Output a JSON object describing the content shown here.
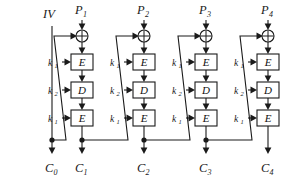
{
  "diagram": {
    "type": "block-cipher-chain",
    "width": 295,
    "height": 176,
    "background": "#ffffff",
    "line_color": "#1a1a1a",
    "box_fill": "#ffffff",
    "iv": {
      "label": "IV",
      "x": 52,
      "y_top": 26,
      "y_dot": 140
    },
    "stages": [
      {
        "index": 1,
        "cx": 82,
        "plaintext": "P",
        "plaintext_sub": "1",
        "ciphertext": "C",
        "ciphertext_sub": "1",
        "ops": [
          {
            "symbol": "E",
            "key": "k",
            "key_sub": "1"
          },
          {
            "symbol": "D",
            "key": "k",
            "key_sub": "2"
          },
          {
            "symbol": "E",
            "key": "k",
            "key_sub": "1"
          }
        ]
      },
      {
        "index": 2,
        "cx": 144,
        "plaintext": "P",
        "plaintext_sub": "2",
        "ciphertext": "C",
        "ciphertext_sub": "2",
        "ops": [
          {
            "symbol": "E",
            "key": "k",
            "key_sub": "1"
          },
          {
            "symbol": "D",
            "key": "k",
            "key_sub": "2"
          },
          {
            "symbol": "E",
            "key": "k",
            "key_sub": "1"
          }
        ]
      },
      {
        "index": 3,
        "cx": 206,
        "plaintext": "P",
        "plaintext_sub": "3",
        "ciphertext": "C",
        "ciphertext_sub": "3",
        "ops": [
          {
            "symbol": "E",
            "key": "k",
            "key_sub": "1"
          },
          {
            "symbol": "D",
            "key": "k",
            "key_sub": "2"
          },
          {
            "symbol": "E",
            "key": "k",
            "key_sub": "1"
          }
        ]
      },
      {
        "index": 4,
        "cx": 268,
        "plaintext": "P",
        "plaintext_sub": "4",
        "ciphertext": "C",
        "ciphertext_sub": "4",
        "ops": [
          {
            "symbol": "E",
            "key": "k",
            "key_sub": "1"
          },
          {
            "symbol": "D",
            "key": "k",
            "key_sub": "2"
          },
          {
            "symbol": "E",
            "key": "k",
            "key_sub": "1"
          }
        ]
      }
    ],
    "outputs": [
      {
        "label": "C",
        "sub": "0",
        "x": 52
      },
      {
        "label": "C",
        "sub": "1",
        "x": 82
      },
      {
        "label": "C",
        "sub": "2",
        "x": 144
      },
      {
        "label": "C",
        "sub": "3",
        "x": 206
      },
      {
        "label": "C",
        "sub": "4",
        "x": 268
      }
    ],
    "xor_symbol": "xor-circle-plus"
  }
}
